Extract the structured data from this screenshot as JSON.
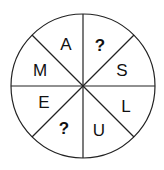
{
  "diagram": {
    "type": "letter-wheel",
    "segments": 8,
    "sectors": [
      {
        "position": "top-left",
        "letter": "A"
      },
      {
        "position": "top-right",
        "letter": "?"
      },
      {
        "position": "right-upper",
        "letter": "S"
      },
      {
        "position": "right-lower",
        "letter": "L"
      },
      {
        "position": "bottom-right",
        "letter": "U"
      },
      {
        "position": "bottom-left",
        "letter": "?"
      },
      {
        "position": "left-lower",
        "letter": "E"
      },
      {
        "position": "left-upper",
        "letter": "M"
      }
    ]
  }
}
